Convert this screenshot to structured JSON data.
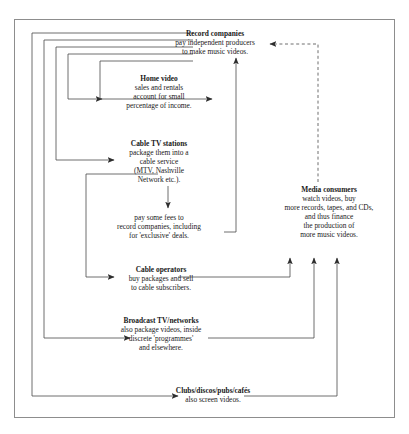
{
  "diagram": {
    "type": "flow-diagram",
    "border_color": "#8d8d8d",
    "line_color": "#3a3a3a",
    "nodes": [
      {
        "id": "record-companies",
        "heading": "Record companies",
        "lines": [
          "pay independent producers",
          "to make music videos."
        ]
      },
      {
        "id": "home-video",
        "heading": "Home video",
        "lines": [
          "sales and rentals",
          "account for small",
          "percentage of income."
        ]
      },
      {
        "id": "cable-tv-stations",
        "heading": "Cable TV stations",
        "lines": [
          "package them into a",
          "cable service",
          "(MTV, Nashville",
          "Network etc.)."
        ]
      },
      {
        "id": "fees",
        "heading": "",
        "lines": [
          "pay some fees to",
          "record companies, including",
          "for 'exclusive' deals."
        ]
      },
      {
        "id": "cable-operators",
        "heading": "Cable operators",
        "lines": [
          "buy packages and sell",
          "to cable subscribers."
        ]
      },
      {
        "id": "broadcast-tv-networks",
        "heading": "Broadcast TV/networks",
        "lines": [
          "also package videos, inside",
          "discrete 'programmes'",
          "and elsewhere."
        ]
      },
      {
        "id": "clubs",
        "heading": "Clubs/discos/pubs/cafés",
        "lines": [
          "also screen videos."
        ]
      },
      {
        "id": "media-consumers",
        "heading": "Media consumers",
        "lines": [
          "watch videos, buy",
          "more records, tapes, and CDs,",
          "and thus finance",
          "the production of",
          "more music videos."
        ]
      }
    ],
    "edges": [
      {
        "from": "record-companies",
        "to": "home-video",
        "style": "solid"
      },
      {
        "from": "record-companies",
        "to": "cable-tv-stations",
        "style": "solid"
      },
      {
        "from": "record-companies",
        "to": "broadcast-tv-networks",
        "style": "solid"
      },
      {
        "from": "record-companies",
        "to": "clubs",
        "style": "solid"
      },
      {
        "from": "home-video",
        "to": "record-companies",
        "style": "solid"
      },
      {
        "from": "cable-tv-stations",
        "to": "fees",
        "style": "solid"
      },
      {
        "from": "fees",
        "to": "record-companies",
        "style": "solid"
      },
      {
        "from": "cable-tv-stations",
        "to": "cable-operators",
        "style": "solid"
      },
      {
        "from": "cable-operators",
        "to": "media-consumers",
        "style": "solid"
      },
      {
        "from": "broadcast-tv-networks",
        "to": "media-consumers",
        "style": "solid"
      },
      {
        "from": "clubs",
        "to": "media-consumers",
        "style": "solid"
      },
      {
        "from": "media-consumers",
        "to": "record-companies",
        "style": "dashed"
      }
    ]
  }
}
